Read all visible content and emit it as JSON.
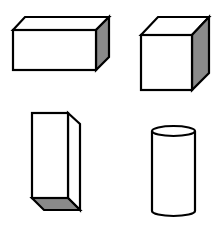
{
  "figure": {
    "line_color": "#000000",
    "shade_color": "#8a8a8a",
    "background": "#ffffff",
    "shapes": [
      {
        "id": "rectangular-prism-horizontal",
        "label": "Rectangular prism (horizontal)",
        "shaded_face": "right"
      },
      {
        "id": "cube",
        "label": "Cube",
        "shaded_face": "right"
      },
      {
        "id": "rectangular-prism-vertical",
        "label": "Rectangular prism (vertical)",
        "shaded_face": "bottom"
      },
      {
        "id": "cylinder",
        "label": "Cylinder",
        "shaded_face": "none"
      }
    ]
  }
}
